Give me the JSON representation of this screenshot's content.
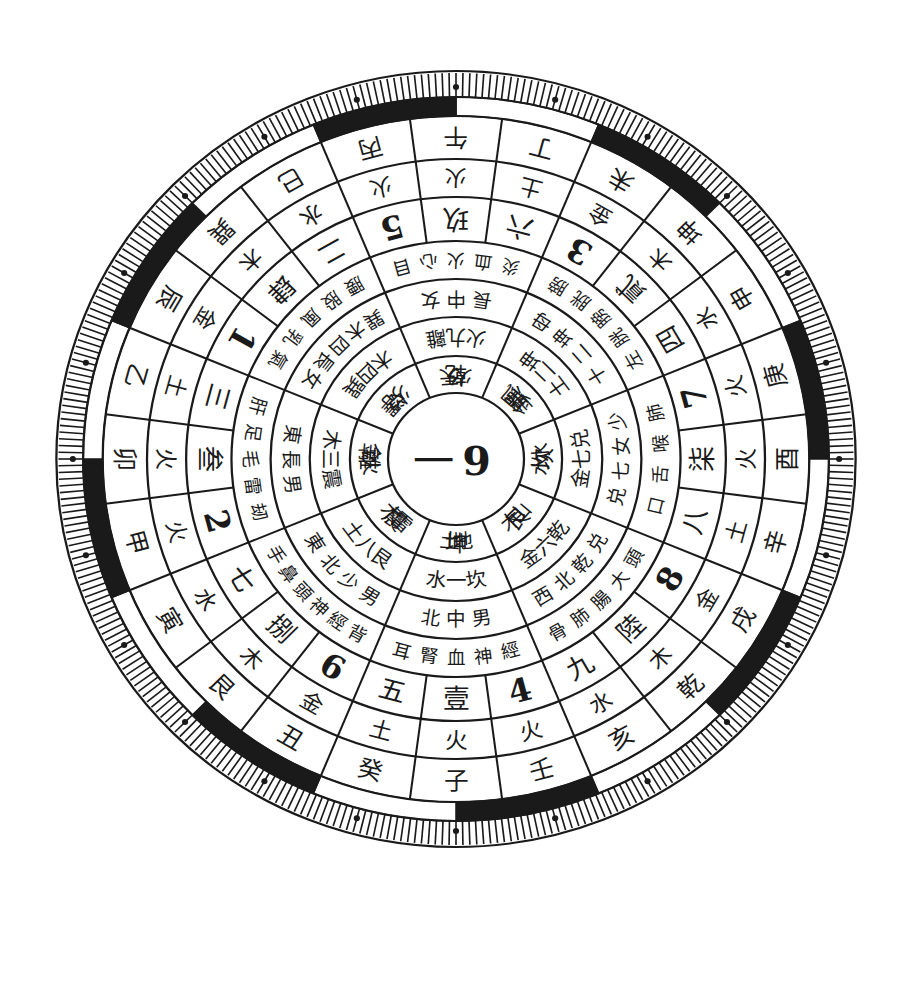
{
  "diagram": {
    "type": "luopan-compass",
    "center": {
      "left": "一",
      "right": "9"
    },
    "colors": {
      "ink": "#1a1a1a",
      "paper": "#ffffff"
    },
    "rings": [
      {
        "name": "twenty-four-mountains",
        "labels": [
          "午",
          "丁",
          "未",
          "坤",
          "申",
          "庚",
          "酉",
          "辛",
          "戌",
          "乾",
          "亥",
          "壬",
          "子",
          "癸",
          "丑",
          "艮",
          "寅",
          "甲",
          "卯",
          "乙",
          "辰",
          "巽",
          "巳",
          "丙"
        ]
      },
      {
        "name": "mountain-elements",
        "labels": [
          "火",
          "土",
          "金",
          "木",
          "水",
          "火",
          "火",
          "土",
          "金",
          "木",
          "水",
          "火",
          "火",
          "土",
          "金",
          "木",
          "水",
          "火",
          "火",
          "土",
          "金",
          "木",
          "水",
          "火"
        ]
      },
      {
        "name": "numbers-ring",
        "labels": [
          "玖",
          "六",
          "3",
          "貳",
          "四",
          "7",
          "柒",
          "八",
          "8",
          "陸",
          "九",
          "4",
          "壹",
          "五",
          "6",
          "捌",
          "七",
          "2",
          "叁",
          "三",
          "1",
          "肆",
          "二",
          "5"
        ]
      },
      {
        "name": "body-parts-ring",
        "sectors": [
          "目心火血炎",
          "膀胱膀胱左",
          "肺喉舌口",
          "頭大腸肺骨",
          "經神血腎耳",
          "背經神頭鼻手",
          "刼雷毛足肝",
          "氣乳風股腰"
        ]
      },
      {
        "name": "direction-ring",
        "sectors": [
          "女中長",
          "母坤二十",
          "少女七兑",
          "兑乾北西",
          "男中北",
          "男少北東",
          "男長東",
          "女長四木巽"
        ]
      },
      {
        "name": "element-number-ring",
        "sectors": [
          "離九火",
          "坤二土",
          "兑七金",
          "乾六金",
          "坎一水",
          "艮八土",
          "震三木",
          "巽四木"
        ]
      },
      {
        "name": "trigram-ring",
        "sectors": [
          "天火",
          "風金",
          "水水",
          "山木",
          "地土",
          "雷木",
          "火金",
          "澤火"
        ]
      },
      {
        "name": "inner-trigram-ring",
        "sectors": [
          "乾",
          "巽",
          "坎",
          "艮",
          "坤",
          "震",
          "離",
          "兑"
        ]
      }
    ],
    "outer_band_pattern": [
      "white",
      "black",
      "white",
      "black",
      "white",
      "black",
      "white",
      "black",
      "white",
      "black",
      "white",
      "black",
      "white",
      "black",
      "white",
      "black"
    ],
    "tick_count": 360
  }
}
